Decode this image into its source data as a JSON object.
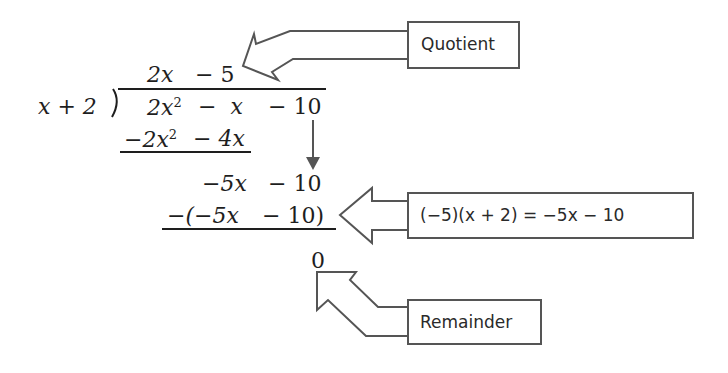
{
  "division": {
    "divisor": "x + 2",
    "quotient": {
      "term1": "2x",
      "term2": "− 5"
    },
    "dividend": {
      "t1": "2x",
      "t1_exp": "2",
      "t2": "−  x",
      "t3": "− 10"
    },
    "step1_subtract": {
      "t1": "−2x",
      "t1_exp": "2",
      "t2": "− 4x"
    },
    "step2_row": {
      "t1": "−5x",
      "t2": "− 10"
    },
    "step2_subtract": {
      "t1": "−(−5x",
      "t2": "− 10)"
    },
    "remainder_value": "0"
  },
  "callouts": {
    "quotient_label": "Quotient",
    "product_label": "(−5)(x + 2) = −5x − 10",
    "remainder_label": "Remainder"
  },
  "colors": {
    "ink": "#1e1e1e",
    "outline": "#555555",
    "down_arrow": "#555555",
    "background": "#ffffff"
  }
}
